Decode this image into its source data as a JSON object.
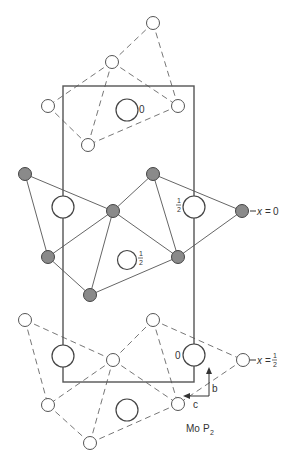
{
  "figure": {
    "compound_label": {
      "main": "Mo",
      "p": "P",
      "sub": "2"
    },
    "unit_cell": {
      "x": 63,
      "y": 86,
      "width": 131,
      "height": 296
    },
    "layers": [
      {
        "name": "top",
        "style": "dashed",
        "atom_type": "open"
      },
      {
        "name": "middle",
        "style": "solid",
        "atom_type": "filled",
        "level_label": {
          "prefix": "x",
          "eq": "=",
          "value": "0"
        }
      },
      {
        "name": "bottom",
        "style": "dashed",
        "atom_type": "open",
        "level_label": {
          "prefix": "x",
          "eq": "=",
          "num": "1",
          "den": "2"
        }
      }
    ],
    "large_atom_labels": {
      "top_center": "0",
      "middle_right": {
        "num": "1",
        "den": "2"
      },
      "middle_center": {
        "num": "1",
        "den": "2"
      },
      "bottom_right": "0"
    },
    "axes": {
      "b": "b",
      "c": "c"
    }
  }
}
